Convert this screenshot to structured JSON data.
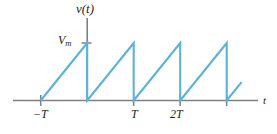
{
  "figure": {
    "background_color": "#ffffff",
    "axis_color": "#808080",
    "wave_color": "#5bb3d9",
    "text_color": "#231f20",
    "width": 277,
    "height": 134
  },
  "labels": {
    "y_axis": "v(t)",
    "x_axis": "t",
    "amplitude": "V",
    "amplitude_sub": "m",
    "tick_neg_T": "−T",
    "tick_T": "T",
    "tick_2T": "2T",
    "tick_2T_num": "2"
  },
  "chart_data": {
    "type": "line",
    "title": "",
    "subtitle": "",
    "xlabel": "t",
    "ylabel": "v(t)",
    "grid": false,
    "legend": null,
    "xlim": [
      -1.02,
      3.62
    ],
    "ylim": [
      0,
      1.18
    ],
    "xtick_values": [
      -1,
      0,
      1,
      2,
      3
    ],
    "xtick_labels": [
      "−T",
      "",
      "T",
      "2T",
      ""
    ],
    "ytick_values": [
      1
    ],
    "ytick_labels": [
      "Vm"
    ],
    "period": 1,
    "amplitude": 1,
    "series": [
      {
        "name": "v(t)",
        "color": "#5bb3d9",
        "x": [
          -1,
          0,
          0,
          1,
          1,
          2,
          2,
          3,
          3,
          3.32
        ],
        "y": [
          0,
          1,
          0,
          1,
          0,
          1,
          0,
          1,
          0,
          0.32
        ]
      }
    ]
  }
}
